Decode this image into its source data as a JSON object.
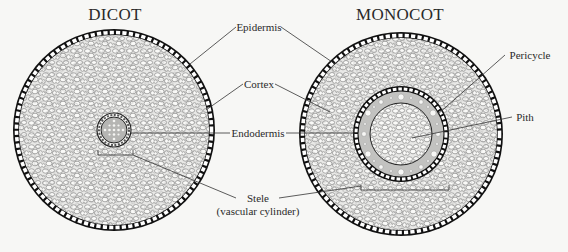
{
  "diagram": {
    "type": "labeled cross-section comparison",
    "panels": [
      {
        "title": "DICOT",
        "structures": [
          "epidermis",
          "cortex",
          "endodermis",
          "stele"
        ]
      },
      {
        "title": "MONOCOT",
        "structures": [
          "epidermis",
          "cortex",
          "endodermis",
          "pericycle",
          "pith",
          "stele"
        ]
      }
    ],
    "labels": {
      "epidermis": "Epidermis",
      "cortex": "Cortex",
      "endodermis": "Endodermis",
      "stele": "Stele",
      "stele_sub": "(vascular cylinder)",
      "pericycle": "Pericycle",
      "pith": "Pith"
    },
    "caption_partial": "Fi..."
  },
  "titles": {
    "dicot": "DICOT",
    "monocot": "MONOCOT"
  },
  "colors": {
    "background": "#f7f7f5",
    "line": "#1a1a1a",
    "cortex_fill": "#e6e6e4",
    "cell_stroke": "#6a6a6a",
    "stele_fill": "#b9b9b7",
    "pericycle_band": "#c4c4c2"
  }
}
